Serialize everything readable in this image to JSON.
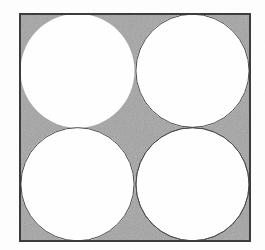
{
  "figure": {
    "kind": "geometric-diagram",
    "title": "Four congruent circles inscribed in a square",
    "description": "A square with a thin dark outline and gray interior containing four equal white circles arranged in a two-by-two grid; each circle is tangent to two sides of the square and to its two neighboring circles.",
    "background_color": "#fefefe"
  },
  "square": {
    "label": "outer square",
    "x": 20,
    "y": 14,
    "width": 230,
    "height": 227,
    "fill_color": "#a3a3a3",
    "stroke_color": "#3a3a3a",
    "stroke_width": 2.0
  },
  "circles": [
    {
      "label": "top-left circle",
      "cx": 77.5,
      "cy": 70.75,
      "r": 57.0,
      "fill_color": "#ffffff",
      "stroke_color": "#4a4a4a",
      "stroke_width": 1.0
    },
    {
      "label": "top-right circle",
      "cx": 192.5,
      "cy": 70.75,
      "r": 57.0,
      "fill_color": "#ffffff",
      "stroke_color": "#4a4a4a",
      "stroke_width": 1.0
    },
    {
      "label": "bottom-left circle",
      "cx": 77.5,
      "cy": 184.25,
      "r": 57.0,
      "fill_color": "#ffffff",
      "stroke_color": "#4a4a4a",
      "stroke_width": 1.0
    },
    {
      "label": "bottom-right circle",
      "cx": 192.5,
      "cy": 184.25,
      "r": 57.0,
      "fill_color": "#ffffff",
      "stroke_color": "#4a4a4a",
      "stroke_width": 1.0
    }
  ],
  "shaded_regions": {
    "label": "gray region between circles and square",
    "color": "#a3a3a3",
    "corner_count": 4,
    "center_region": "astroid"
  },
  "caption": {
    "text": ""
  }
}
